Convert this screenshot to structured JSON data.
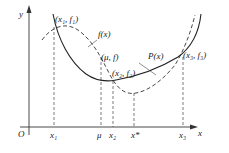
{
  "axes": {
    "y_label": "y",
    "x_label": "x",
    "origin_label": "O"
  },
  "curves": {
    "f_label": "f(x)",
    "p_label": "P(x)"
  },
  "points": {
    "p1": "(x₁, f₁)",
    "pmu": "(μ, f)",
    "p2": "(x₂, f₂)",
    "p3": "(x₃, f₃)"
  },
  "ticks": {
    "x1": "x₁",
    "mu": "μ",
    "x2": "x₂",
    "xstar": "x*",
    "x3": "x₃"
  }
}
